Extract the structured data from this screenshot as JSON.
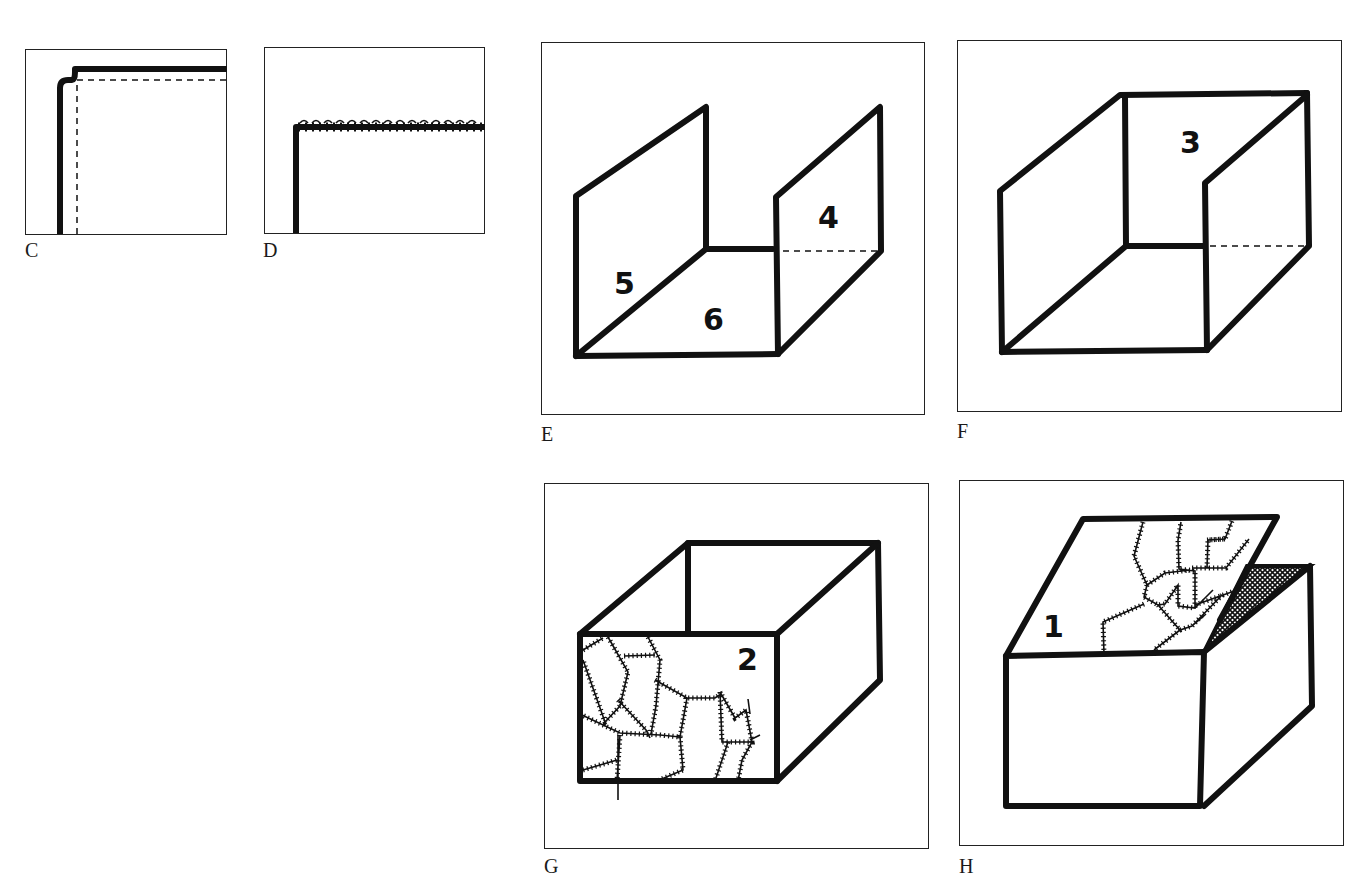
{
  "figure": {
    "panels": [
      {
        "id": "C",
        "label": "C",
        "description": "Corner of fabric piece with thick seam line and dashed stitching line"
      },
      {
        "id": "D",
        "label": "D",
        "description": "Corner with overcast (whip) stitched edge"
      },
      {
        "id": "E",
        "label": "E",
        "description": "Open box: two sides and bottom",
        "face_numbers": [
          "5",
          "6",
          "4"
        ]
      },
      {
        "id": "F",
        "label": "F",
        "description": "Box with back panel added",
        "face_numbers": [
          "3"
        ]
      },
      {
        "id": "G",
        "label": "G",
        "description": "Box with patchwork front panel",
        "face_numbers": [
          "2"
        ]
      },
      {
        "id": "H",
        "label": "H",
        "description": "Closed box with patchwork lid folded over, lining shown cross-hatched",
        "face_numbers": [
          "1"
        ]
      }
    ]
  },
  "colors": {
    "ink": "#111111",
    "paper": "#ffffff",
    "frame": "#222222"
  }
}
